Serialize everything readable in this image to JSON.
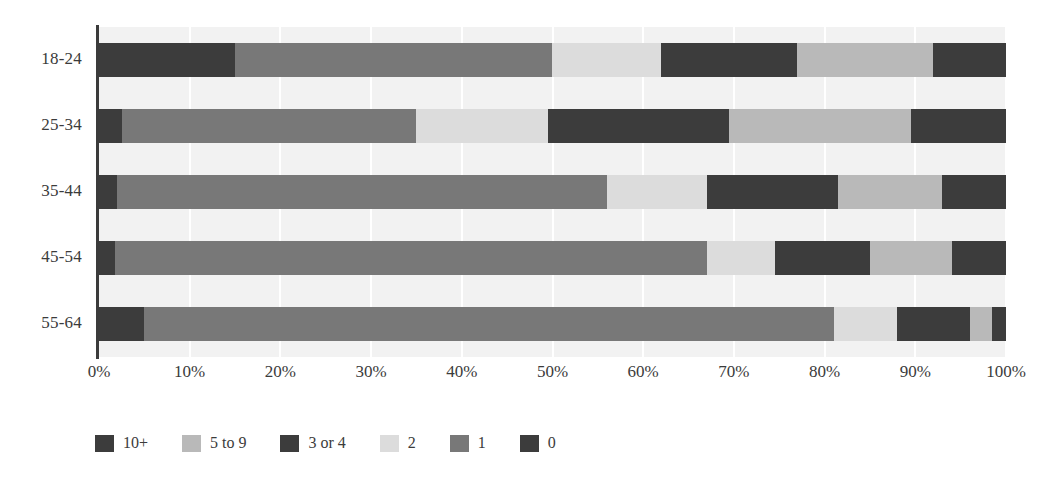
{
  "chart_data": {
    "type": "bar",
    "orientation": "horizontal",
    "stacked": true,
    "normalized_percent": true,
    "title": "",
    "subtitle": "",
    "xlabel": "",
    "ylabel": "",
    "xlim": [
      0,
      100
    ],
    "grid": true,
    "legend_position": "bottom-left",
    "categories": [
      "18-24",
      "25-34",
      "35-44",
      "45-54",
      "55-64"
    ],
    "tick_labels": [
      "0%",
      "10%",
      "20%",
      "30%",
      "40%",
      "50%",
      "60%",
      "70%",
      "80%",
      "90%",
      "100%"
    ],
    "tick_values": [
      0,
      10,
      20,
      30,
      40,
      50,
      60,
      70,
      80,
      90,
      100
    ],
    "series": [
      {
        "name": "0",
        "color": "#3c3c3c",
        "values": [
          15.0,
          2.5,
          2.0,
          1.8,
          5.0
        ]
      },
      {
        "name": "1",
        "color": "#787878",
        "values": [
          35.0,
          32.5,
          54.0,
          65.2,
          76.0
        ]
      },
      {
        "name": "2",
        "color": "#dcdcdc",
        "values": [
          12.0,
          14.5,
          11.0,
          7.5,
          7.0
        ]
      },
      {
        "name": "3 or 4",
        "color": "#3c3c3c",
        "values": [
          15.0,
          20.0,
          14.5,
          10.5,
          8.0
        ]
      },
      {
        "name": "5 to 9",
        "color": "#b9b9b9",
        "values": [
          15.0,
          20.0,
          11.5,
          9.0,
          2.5
        ]
      },
      {
        "name": "10+",
        "color": "#3c3c3c",
        "values": [
          8.0,
          10.5,
          7.0,
          6.0,
          1.5
        ]
      }
    ],
    "legend_entries": [
      {
        "label": "10+",
        "color": "#3c3c3c"
      },
      {
        "label": "5 to 9",
        "color": "#b9b9b9"
      },
      {
        "label": "3 or 4",
        "color": "#3c3c3c"
      },
      {
        "label": "2",
        "color": "#dcdcdc"
      },
      {
        "label": "1",
        "color": "#787878"
      },
      {
        "label": "0",
        "color": "#3c3c3c"
      }
    ],
    "colors": {
      "plot_background": "#f2f2f2",
      "gridline": "#ffffff",
      "axis": "#3b3b3b",
      "text": "#3b3b3b",
      "page_background": "#ffffff"
    }
  }
}
